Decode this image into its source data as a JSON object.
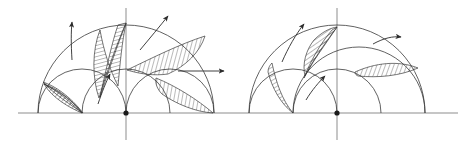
{
  "figure": {
    "kind": "geometric-diagram",
    "canvas": {
      "width": 463,
      "height": 142,
      "background": "#ffffff"
    },
    "colors": {
      "curve_stroke": "#3a3a3a",
      "axis_stroke": "#8d8d8d",
      "arrow_stroke": "#2b2b2b",
      "hatch_stroke": "#3a3a3a",
      "center_dot": "#1b1b1b",
      "paper": "#ffffff"
    },
    "panels": [
      {
        "id": "left-panel",
        "name": "left-construction",
        "center": {
          "x": 126,
          "y": 113
        },
        "baseline_y": 113,
        "baseline": {
          "x1": 18,
          "x2": 232
        },
        "center_dot_radius": 2.6,
        "vertical_axis": {
          "x": 126,
          "y1": 8,
          "y2": 140
        },
        "horizontal_ray": {
          "x1": 126,
          "x2": 232,
          "y": 113
        },
        "arcs": [
          {
            "name": "outer-semicircle",
            "cx": 126,
            "cy": 113,
            "r": 88,
            "sweep": "upper-half"
          },
          {
            "name": "left-medium-semicircle",
            "cx": 126,
            "cy": 113,
            "r": 44,
            "sweep": "upper-half"
          },
          {
            "name": "right-medium-semicircle",
            "cx": 170,
            "cy": 113,
            "r": 44,
            "sweep": "upper-half"
          },
          {
            "name": "left-small-arc",
            "cx": 82,
            "cy": 113,
            "r": 44,
            "sweep": "upper-half"
          }
        ],
        "hatched_regions": [
          {
            "name": "lune-lower-left",
            "hatch_angle_deg": 40
          },
          {
            "name": "lune-upper-left",
            "hatch_angle_deg": 75
          },
          {
            "name": "lune-upper-right",
            "hatch_angle_deg": 15
          },
          {
            "name": "lune-lower-right",
            "hatch_angle_deg": 10
          }
        ],
        "arrows": [
          {
            "name": "arrow-up-left",
            "direction": "up",
            "x1": 72,
            "y1": 60,
            "x2": 72,
            "y2": 22
          },
          {
            "name": "arrow-up-right-diagonal",
            "direction": "up-right",
            "x1": 140,
            "y1": 50,
            "x2": 168,
            "y2": 16
          },
          {
            "name": "arrow-up-inner",
            "direction": "up-right",
            "x1": 98,
            "y1": 104,
            "x2": 110,
            "y2": 74
          },
          {
            "name": "arrow-right",
            "direction": "right",
            "x1": 178,
            "y1": 71,
            "x2": 224,
            "y2": 71
          }
        ]
      },
      {
        "id": "right-panel",
        "name": "right-construction",
        "center": {
          "x": 337,
          "y": 113
        },
        "baseline_y": 113,
        "baseline": {
          "x1": 232,
          "x2": 458
        },
        "center_dot_radius": 2.6,
        "vertical_axis": {
          "x": 337,
          "y1": 8,
          "y2": 140
        },
        "horizontal_ray": {
          "x1": 337,
          "x2": 458,
          "y": 113
        },
        "arcs": [
          {
            "name": "outer-semicircle",
            "cx": 337,
            "cy": 113,
            "r": 88,
            "sweep": "upper-half"
          },
          {
            "name": "left-medium-semicircle",
            "cx": 293,
            "cy": 113,
            "r": 44,
            "sweep": "upper-half"
          },
          {
            "name": "right-medium-semicircle",
            "cx": 337,
            "cy": 113,
            "r": 44,
            "sweep": "upper-half"
          },
          {
            "name": "inner-small-arc",
            "cx": 315,
            "cy": 113,
            "r": 66,
            "sweep": "upper-half"
          }
        ],
        "hatched_regions": [
          {
            "name": "lune-far-left",
            "hatch_angle_deg": 60
          },
          {
            "name": "lune-middle",
            "hatch_angle_deg": 55
          },
          {
            "name": "lune-right-flat",
            "hatch_angle_deg": 20
          }
        ],
        "arrows": [
          {
            "name": "arrow-up-left-diagonal",
            "direction": "up-right",
            "x1": 282,
            "y1": 62,
            "x2": 304,
            "y2": 24
          },
          {
            "name": "arrow-right-upper",
            "direction": "right",
            "x1": 373,
            "y1": 44,
            "x2": 401,
            "y2": 37
          },
          {
            "name": "arrow-up-inner",
            "direction": "up-right",
            "x1": 306,
            "y1": 100,
            "x2": 325,
            "y2": 76
          }
        ]
      }
    ]
  }
}
